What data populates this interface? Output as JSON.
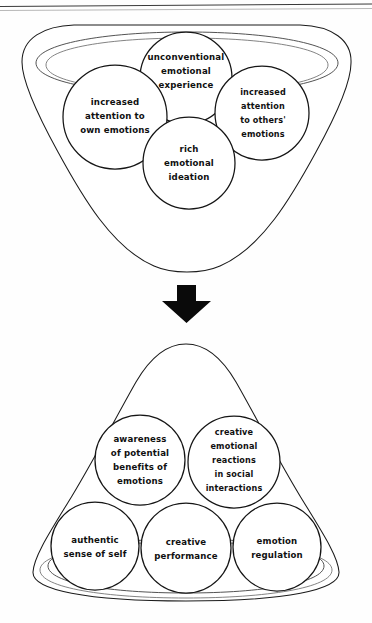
{
  "page": {
    "background_color": "#fefefe",
    "ink_color": "#151515",
    "width": 372,
    "height": 623
  },
  "diagram": {
    "title": "",
    "type": "two-stage funnel concept diagram",
    "transition_icon": "down-arrow-icon",
    "stages": [
      {
        "id": "stage-antecedents",
        "container_shape": "inverted-funnel",
        "label": "",
        "nodes": [
          {
            "id": "unconventional-emotional-experience",
            "lines": [
              "unconventional",
              "emotional",
              "experience"
            ],
            "cx": 186,
            "cy": 78,
            "r": 46
          },
          {
            "id": "increased-attention-own-emotions",
            "lines": [
              "increased",
              "attention to",
              "own emotions"
            ],
            "cx": 115,
            "cy": 117,
            "r": 52
          },
          {
            "id": "increased-attention-others-emotions",
            "lines": [
              "increased",
              "attention",
              "to others'",
              "emotions"
            ],
            "cx": 262,
            "cy": 113,
            "r": 47
          },
          {
            "id": "rich-emotional-ideation",
            "lines": [
              "rich",
              "emotional",
              "ideation"
            ],
            "cx": 189,
            "cy": 163,
            "r": 46
          }
        ]
      },
      {
        "id": "stage-outcomes",
        "container_shape": "upright-funnel",
        "label": "",
        "nodes": [
          {
            "id": "awareness-of-potential-benefits-of-emotions",
            "lines": [
              "awareness",
              "of potential",
              "benefits of",
              "emotions"
            ],
            "cx": 140,
            "cy": 460,
            "r": 45
          },
          {
            "id": "creative-emotional-reactions-in-social-interactions",
            "lines": [
              "creative",
              "emotional",
              "reactions",
              "in social",
              "interactions"
            ],
            "cx": 234,
            "cy": 462,
            "r": 46
          },
          {
            "id": "authentic-sense-of-self",
            "lines": [
              "authentic",
              "sense of self"
            ],
            "cx": 95,
            "cy": 546,
            "r": 44
          },
          {
            "id": "creative-performance",
            "lines": [
              "creative",
              "performance"
            ],
            "cx": 186,
            "cy": 548,
            "r": 45
          },
          {
            "id": "emotion-regulation",
            "lines": [
              "emotion",
              "regulation"
            ],
            "cx": 277,
            "cy": 547,
            "r": 44
          }
        ]
      }
    ]
  }
}
